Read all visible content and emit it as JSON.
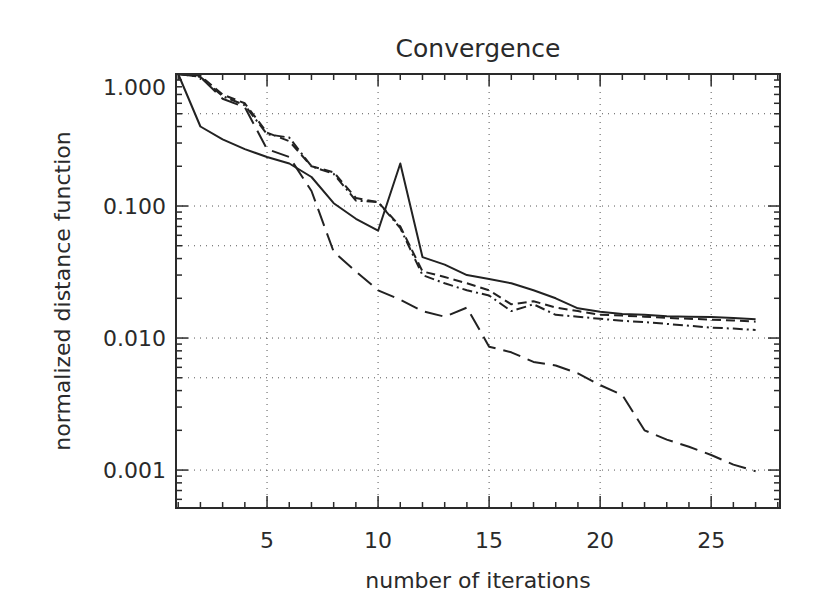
{
  "chart_data": {
    "type": "line",
    "title": "Convergence",
    "xlabel": "number of iterations",
    "ylabel": "normalized distance function",
    "xscale": "linear",
    "yscale": "log",
    "xlim": [
      0.9,
      28.1
    ],
    "ylim": [
      0.000516,
      1.0
    ],
    "x_ticks": [
      5,
      10,
      15,
      20,
      25
    ],
    "x_tick_labels": [
      "5",
      "10",
      "15",
      "20",
      "25"
    ],
    "y_ticks": [
      1.0,
      0.1,
      0.01,
      0.001
    ],
    "y_tick_labels": [
      "1.000",
      "0.100",
      "0.010",
      "0.001"
    ],
    "grid": true,
    "grid_style": "dotted",
    "legend": null,
    "x": [
      1,
      2,
      3,
      4,
      5,
      6,
      7,
      8,
      9,
      10,
      11,
      12,
      13,
      14,
      15,
      16,
      17,
      18,
      19,
      20,
      21,
      22,
      23,
      24,
      25,
      26,
      27
    ],
    "series": [
      {
        "name": "solid",
        "style": "solid",
        "values": [
          1.0,
          0.4,
          0.32,
          0.27,
          0.235,
          0.21,
          0.166,
          0.105,
          0.08,
          0.065,
          0.21,
          0.041,
          0.036,
          0.03,
          0.028,
          0.026,
          0.023,
          0.02,
          0.0168,
          0.0158,
          0.0152,
          0.015,
          0.0146,
          0.0145,
          0.0144,
          0.0142,
          0.0139
        ]
      },
      {
        "name": "short-dash",
        "style": "dashed",
        "values": [
          1.0,
          0.97,
          0.7,
          0.6,
          0.36,
          0.31,
          0.2,
          0.18,
          0.115,
          0.107,
          0.07,
          0.032,
          0.029,
          0.026,
          0.023,
          0.018,
          0.019,
          0.017,
          0.016,
          0.015,
          0.0148,
          0.0145,
          0.0142,
          0.014,
          0.0138,
          0.0136,
          0.0133
        ]
      },
      {
        "name": "dash-dot",
        "style": "dash-dot",
        "values": [
          1.0,
          0.95,
          0.68,
          0.58,
          0.35,
          0.33,
          0.2,
          0.175,
          0.11,
          0.107,
          0.068,
          0.03,
          0.026,
          0.023,
          0.021,
          0.016,
          0.018,
          0.015,
          0.0145,
          0.014,
          0.0135,
          0.0132,
          0.0128,
          0.0124,
          0.012,
          0.0118,
          0.0115
        ]
      },
      {
        "name": "long-dash",
        "style": "long-dashed",
        "values": [
          1.0,
          0.95,
          0.65,
          0.56,
          0.27,
          0.235,
          0.13,
          0.045,
          0.032,
          0.023,
          0.0195,
          0.016,
          0.0145,
          0.017,
          0.0086,
          0.0078,
          0.0066,
          0.0062,
          0.0054,
          0.0044,
          0.0037,
          0.002,
          0.0017,
          0.0015,
          0.0013,
          0.0011,
          0.00098
        ]
      }
    ]
  }
}
